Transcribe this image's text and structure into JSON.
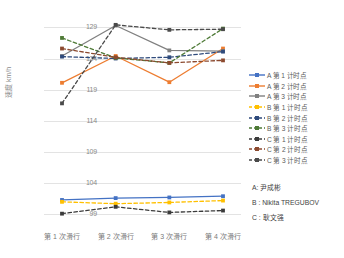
{
  "chart_data": {
    "type": "line",
    "title": "",
    "xlabel": "",
    "ylabel": "速度 km/h",
    "categories": [
      "第 1 次滑行",
      "第 2 次滑行",
      "第 3 次滑行",
      "第 4 次滑行"
    ],
    "yticks": [
      99,
      104,
      109,
      114,
      119,
      124,
      129
    ],
    "ylim": [
      96.8,
      130.5
    ],
    "grid": true,
    "legend_position": "right",
    "series": [
      {
        "name": "A 第 1 计时点",
        "color": "#4472C4",
        "style": "solid",
        "marker": "square",
        "values": [
          101.3,
          101.6,
          101.7,
          101.9
        ]
      },
      {
        "name": "A 第 2 计时点",
        "color": "#ED7D31",
        "style": "solid",
        "marker": "square",
        "values": [
          120.1,
          124.4,
          120.2,
          125.6
        ]
      },
      {
        "name": "A 第 3 计时点",
        "color": "#808080",
        "style": "solid",
        "marker": "square",
        "values": [
          124.4,
          129.3,
          125.3,
          125.2
        ]
      },
      {
        "name": "B 第 1 计时点",
        "color": "#FFC000",
        "style": "dashed",
        "marker": "square",
        "values": [
          101.0,
          100.7,
          100.9,
          101.2
        ]
      },
      {
        "name": "B 第 2 计时点",
        "color": "#2F4B7C",
        "style": "dashed",
        "marker": "square",
        "values": [
          124.3,
          124.0,
          124.2,
          125.1
        ]
      },
      {
        "name": "B 第 3 计时点",
        "color": "#4E7A36",
        "style": "dashed",
        "marker": "square",
        "values": [
          127.3,
          124.1,
          123.3,
          128.8
        ]
      },
      {
        "name": "C 第 1 计时点",
        "color": "#3B3B3B",
        "style": "dashed",
        "marker": "square",
        "values": [
          99.1,
          100.2,
          99.3,
          99.6
        ]
      },
      {
        "name": "C 第 2 计时点",
        "color": "#8C4A2F",
        "style": "dashed",
        "marker": "square",
        "values": [
          125.6,
          124.2,
          123.3,
          123.7
        ]
      },
      {
        "name": "C 第 3 计时点",
        "color": "#4A4A4A",
        "style": "dashed",
        "marker": "square",
        "values": [
          116.8,
          129.4,
          128.6,
          128.7
        ]
      }
    ]
  },
  "notes": [
    "A: 尹成彬",
    "B : Nikita TREGUBOV",
    "C : 耿文强"
  ]
}
